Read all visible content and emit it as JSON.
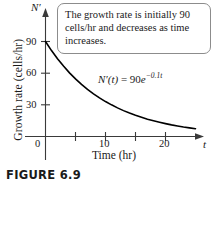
{
  "figure": {
    "caption": "FIGURE 6.9"
  },
  "callout": {
    "text": "The growth rate is initially 90 cells/hr and decreases as time increases."
  },
  "annotation": {
    "equation_lhs": "N′(t)",
    "equation_eq": " = ",
    "equation_coefficient": "90",
    "equation_base": "e",
    "equation_exponent": "−0.1t"
  },
  "axes": {
    "y_title": "Growth rate (cells/hr)",
    "x_title": "Time (hr)",
    "y_variable": "N′",
    "x_variable": "t"
  },
  "chart_data": {
    "type": "line",
    "title": "",
    "subtitle": "",
    "xlabel": "Time (hr)",
    "ylabel": "Growth rate (cells/hr)",
    "x_variable": "t",
    "y_variable": "N′",
    "equation": "N′(t) = 90e^(-0.1t)",
    "xlim": [
      0,
      26
    ],
    "ylim": [
      0,
      100
    ],
    "xticks": [
      0,
      5,
      10,
      15,
      20
    ],
    "xtick_labels": [
      "0",
      "",
      "10",
      "",
      "20"
    ],
    "yticks": [
      0,
      30,
      60,
      90
    ],
    "ytick_labels": [
      "0",
      "30",
      "60",
      "90"
    ],
    "grid": false,
    "legend": "none",
    "axis_arrows": true,
    "series": [
      {
        "name": "N'(t) = 90e^(-0.1t)",
        "color": "#000000",
        "x": [
          0,
          1,
          2,
          3,
          4,
          5,
          6,
          7,
          8,
          9,
          10,
          11,
          12,
          13,
          14,
          15,
          16,
          17,
          18,
          19,
          20,
          21,
          22,
          23,
          24,
          25,
          26
        ],
        "y": [
          90.0,
          81.4,
          73.7,
          66.7,
          60.3,
          54.6,
          49.4,
          44.7,
          40.4,
          36.6,
          33.1,
          30.0,
          27.1,
          24.5,
          22.2,
          20.1,
          18.2,
          16.4,
          14.9,
          13.5,
          12.2,
          11.0,
          10.0,
          9.0,
          8.2,
          7.4,
          6.7
        ]
      }
    ],
    "annotations": [
      {
        "text": "The growth rate is initially 90 cells/hr and decreases as time increases.",
        "type": "callout-box"
      },
      {
        "text": "N′(t) = 90e^(-0.1t)",
        "type": "curve-label",
        "x": 10,
        "y": 45
      }
    ]
  },
  "colors": {
    "curve": "#000000",
    "axis": "#3a3a3a",
    "callout_border": "#8c8c8c",
    "background": "#ffffff"
  }
}
